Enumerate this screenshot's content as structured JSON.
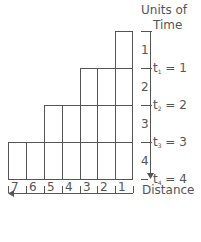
{
  "axis_title": {
    "line1": "Units of",
    "line2": "Time"
  },
  "distance_label": "Distance",
  "time_intervals": [
    "1",
    "2",
    "3",
    "4"
  ],
  "time_markers": [
    {
      "t": "t",
      "sub": "1",
      "eq": " = 1"
    },
    {
      "t": "t",
      "sub": "2",
      "eq": " = 2"
    },
    {
      "t": "t",
      "sub": "3",
      "eq": " = 3"
    },
    {
      "t": "t",
      "sub": "4",
      "eq": " = 4"
    }
  ],
  "distance_ticks": [
    "7",
    "6",
    "5",
    "4",
    "3",
    "2",
    "1"
  ],
  "columns_heights": [
    1,
    1,
    2,
    2,
    3,
    3,
    4
  ],
  "colors": {
    "line": "#555555",
    "text": "#555555"
  }
}
